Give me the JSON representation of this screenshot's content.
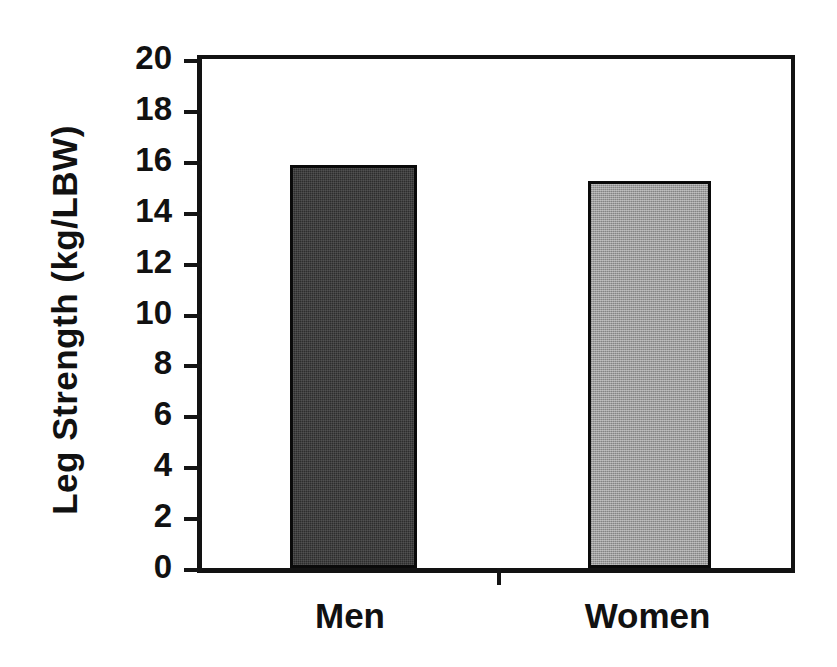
{
  "chart_data": {
    "type": "bar",
    "title": "",
    "xlabel": "",
    "ylabel": "Leg Strength (kg/LBW)",
    "categories": [
      "Men",
      "Women"
    ],
    "values": [
      15.85,
      15.2
    ],
    "series": [
      {
        "name": "Leg Strength",
        "values": [
          15.85,
          15.2
        ]
      }
    ],
    "ylim": [
      0,
      20
    ],
    "ytick_step": 2,
    "ytick_labels": [
      "20",
      "18",
      "16",
      "14",
      "12",
      "10",
      "8",
      "6",
      "4",
      "2",
      "0"
    ],
    "ytick_values": [
      20,
      18,
      16,
      14,
      12,
      10,
      8,
      6,
      4,
      2,
      0
    ],
    "grid": false,
    "legend": false,
    "legend_position": "none",
    "bar_styles": [
      {
        "category": "Men",
        "fill": "#2d2d2d",
        "pattern": "dense-dither",
        "edge": "#0a0a0a"
      },
      {
        "category": "Women",
        "fill": "#9e9e9e",
        "pattern": "checker-dither",
        "edge": "#0a0a0a"
      }
    ],
    "axis_color": "#121212",
    "background": "#ffffff"
  },
  "axis": {
    "y_title": "Leg Strength (kg/LBW)"
  },
  "labels": {
    "men": "Men",
    "women": "Women"
  }
}
